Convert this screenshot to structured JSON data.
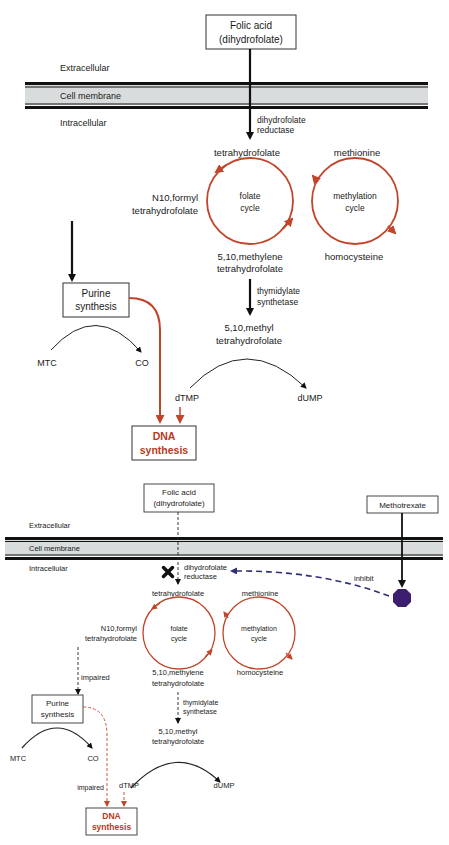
{
  "panel_normal": {
    "folic_acid_box": [
      "Folic acid",
      "(dihydrofolate)"
    ],
    "extracellular": "Extracellular",
    "cell_membrane": "Cell membrane",
    "intracellular": "Intracellular",
    "enzyme_dhfr": [
      "dihydrofolate",
      "reductase"
    ],
    "tetrahydrofolate": "tetrahydrofolate",
    "methionine": "methionine",
    "folate_cycle": [
      "folate",
      "cycle"
    ],
    "methylation_cycle": [
      "methylation",
      "cycle"
    ],
    "n10_formyl": [
      "N10,formyl",
      "tetrahydrofolate"
    ],
    "methylene": [
      "5,10,methylene",
      "tetrahydrofolate"
    ],
    "homocysteine": "homocysteine",
    "enzyme_ts": [
      "thymidylate",
      "synthetase"
    ],
    "methyl": [
      "5,10,methyl",
      "tetrahydrofolate"
    ],
    "purine_box": [
      "Purine",
      "synthesis"
    ],
    "mtc": "MTC",
    "co": "CO",
    "dtmp": "dTMP",
    "dump": "dUMP",
    "dna_box": [
      "DNA",
      "synthesis"
    ]
  },
  "panel_inhibited": {
    "folic_acid_box": [
      "Folic acid",
      "(dihydrofolate)"
    ],
    "methotrexate_box": "Methotrexate",
    "extracellular": "Extracellular",
    "cell_membrane": "Cell membrane",
    "intracellular": "Intracellular",
    "enzyme_dhfr": [
      "dihydrofolate",
      "reductase"
    ],
    "inhibit": "inhibit",
    "tetrahydrofolate": "tetrahydrofolate",
    "methionine": "methionine",
    "folate_cycle": [
      "folate",
      "cycle"
    ],
    "methylation_cycle": [
      "methylation",
      "cycle"
    ],
    "n10_formyl": [
      "N10,formyl",
      "tetrahydrofolate"
    ],
    "impaired_1": "impaired",
    "methylene": [
      "5,10,methylene",
      "tetrahydrofolate"
    ],
    "homocysteine": "homocysteine",
    "enzyme_ts": [
      "thymidylate",
      "synthetase"
    ],
    "methyl": [
      "5,10,methyl",
      "tetrahydrofolate"
    ],
    "purine_box": [
      "Purine",
      "synthesis"
    ],
    "mtc": "MTC",
    "co": "CO",
    "dtmp": "dTMP",
    "dump": "dUMP",
    "impaired_2": "impaired",
    "dna_box": [
      "DNA",
      "synthesis"
    ]
  },
  "colors": {
    "cycle_red": "#c0452a",
    "dna_red": "#b83a22",
    "membrane_fill": "#d9dcdc",
    "membrane_line": "#111111",
    "methotrexate_purple": "#3d1d6e",
    "inhibit_dash": "#2e2e7a"
  }
}
